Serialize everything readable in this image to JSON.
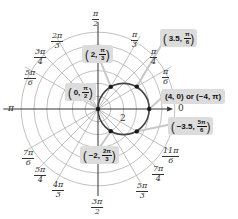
{
  "chart_data": {
    "type": "polar",
    "title": "",
    "curve": {
      "equation": "r = 4cos(theta)",
      "description": "circle of diameter 4 passing through the pole, centered at (2, 0)"
    },
    "origin_px": [
      98,
      109
    ],
    "px_per_unit": 12.8,
    "rings": [
      1,
      2,
      3,
      4,
      5,
      6
    ],
    "radial_tick_label": "2",
    "angle_labels": [
      {
        "angle_deg": 0,
        "text": "0"
      },
      {
        "angle_deg": 30,
        "num": "π",
        "den": "6"
      },
      {
        "angle_deg": 45,
        "num": "π",
        "den": "4"
      },
      {
        "angle_deg": 60,
        "num": "π",
        "den": "3"
      },
      {
        "angle_deg": 90,
        "num": "π",
        "den": "2"
      },
      {
        "angle_deg": 120,
        "num": "2π",
        "den": "3"
      },
      {
        "angle_deg": 135,
        "num": "3π",
        "den": "4"
      },
      {
        "angle_deg": 150,
        "num": "5π",
        "den": "6"
      },
      {
        "angle_deg": 180,
        "text": "π"
      },
      {
        "angle_deg": 210,
        "num": "7π",
        "den": "6"
      },
      {
        "angle_deg": 225,
        "num": "5π",
        "den": "4"
      },
      {
        "angle_deg": 240,
        "num": "4π",
        "den": "3"
      },
      {
        "angle_deg": 270,
        "num": "3π",
        "den": "2"
      },
      {
        "angle_deg": 300,
        "num": "5π",
        "den": "3"
      },
      {
        "angle_deg": 315,
        "num": "7π",
        "den": "4"
      },
      {
        "angle_deg": 330,
        "num": "11π",
        "den": "6"
      }
    ],
    "points": [
      {
        "r": 0,
        "theta_deg": 90,
        "label": "(0, π/2)"
      },
      {
        "r": 2,
        "theta_deg": 60,
        "label": "(2, π/3)"
      },
      {
        "r": 3.5,
        "theta_deg": 30,
        "label": "(3.5, π/6)"
      },
      {
        "r": 4,
        "theta_deg": 0,
        "label": "(4, 0) or (−4, π)"
      },
      {
        "r": -3.5,
        "theta_deg": 150,
        "label": "(−3.5, 5π/6)"
      },
      {
        "r": -2,
        "theta_deg": 120,
        "label": "(−2, 2π/3)"
      }
    ],
    "grid": true
  },
  "callouts": {
    "zero_pi2": {
      "a": "0,",
      "num": "π",
      "den": "2"
    },
    "two_pi3": {
      "a": "2,",
      "num": "π",
      "den": "3"
    },
    "three5_pi6": {
      "a": "3.5,",
      "num": "π",
      "den": "6"
    },
    "four_zero": {
      "text": "(4, 0) or (−4, π)"
    },
    "m35_5pi6": {
      "a": "−3.5,",
      "num": "5π",
      "den": "6"
    },
    "m2_2pi3": {
      "a": "−2,",
      "num": "2π",
      "den": "3"
    }
  },
  "colors": {
    "grid": "#b0b0b0",
    "axis": "#333333",
    "curve": "#444444",
    "point": "#1a1a1a",
    "callout_bg": "#dcdcdc",
    "leader": "#c8c8c8"
  }
}
